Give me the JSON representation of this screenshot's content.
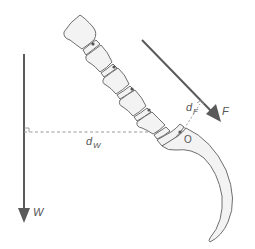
{
  "diagram": {
    "title": "",
    "labels": {
      "weight": "W",
      "force": "F",
      "pivot": "O",
      "weight_arm": "d",
      "weight_arm_sub": "W",
      "force_arm": "d",
      "force_arm_sub": "F"
    },
    "colors": {
      "stroke": "#6e6e6e",
      "arrow": "#5a5a5a",
      "fill": "#f3f3f3",
      "dashed": "#999999"
    }
  }
}
